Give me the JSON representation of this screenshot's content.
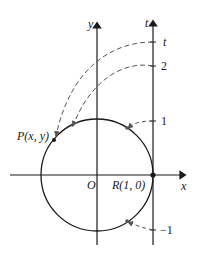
{
  "figure": {
    "axes": {
      "x_label": "x",
      "y_label": "y",
      "t_label": "t",
      "origin_label": "O"
    },
    "points": {
      "P_label": "P(x, y)",
      "R_label": "R(1, 0)"
    },
    "t_ticks": [
      {
        "label": "t"
      },
      {
        "label": "2"
      },
      {
        "label": "1"
      },
      {
        "label": "−1"
      }
    ],
    "colors": {
      "ink": "#1a1a1a",
      "dashed": "#555555"
    }
  }
}
